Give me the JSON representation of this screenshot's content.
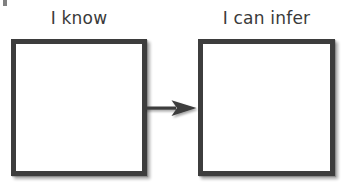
{
  "page": {
    "background_color": "#ffffff",
    "width": 344,
    "height": 190,
    "ink_color": "#3d3d3d",
    "text_color": "#3a3a3a"
  },
  "organizer": {
    "columns": [
      {
        "label": "I know",
        "box_fill": "#ffffff",
        "box_border_color": "#3d3d3d",
        "content": ""
      },
      {
        "label": "I can infer",
        "box_fill": "#ffffff",
        "box_border_color": "#3d3d3d",
        "content": ""
      }
    ],
    "connector": {
      "name": "arrow",
      "direction": "right",
      "color": "#3d3d3d"
    }
  }
}
